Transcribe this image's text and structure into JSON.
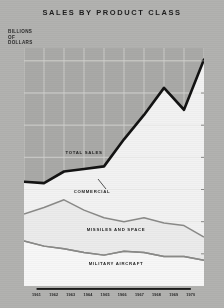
{
  "title": "SALES BY PRODUCT CLASS",
  "y_axis_label_lines": [
    "BILLIONS",
    "OF",
    "DOLLARS"
  ],
  "series_labels": {
    "total": "TOTAL SALES",
    "commercial": "COMMERCIAL",
    "missiles": "MISSILES AND SPACE",
    "military": "MILITARY AIRCRAFT"
  },
  "colors": {
    "background_upper": "#a9a9a7",
    "background_lower": "#f2f2f2",
    "total_line": "#131313",
    "sub_line": "#8a8a88",
    "text": "#1d1d1d",
    "grid": "#cfcfcd"
  },
  "chart_data": {
    "type": "line",
    "title": "SALES BY PRODUCT CLASS",
    "xlabel": "",
    "ylabel": "BILLIONS OF DOLLARS",
    "x": [
      1961,
      1962,
      1963,
      1964,
      1965,
      1966,
      1967,
      1968,
      1969,
      1970
    ],
    "categories": [
      "1961",
      "1962",
      "1963",
      "1964",
      "1965",
      "1966",
      "1967",
      "1968",
      "1969",
      "1970"
    ],
    "ylim": [
      0.0,
      3.7
    ],
    "yticks": [
      0.5,
      1.0,
      1.5,
      2.0,
      2.5,
      3.0,
      3.5
    ],
    "ytick_labels": [
      "0.5",
      "1.0",
      "1.5",
      "2.0",
      "2.5",
      "3.0",
      "3.5"
    ],
    "grid": true,
    "legend": "inline-annotations",
    "series": [
      {
        "name": "TOTAL SALES",
        "values": [
          1.62,
          1.6,
          1.78,
          1.82,
          1.86,
          2.28,
          2.66,
          3.08,
          2.74,
          3.52
        ]
      },
      {
        "name": "COMMERCIAL",
        "values": [
          1.12,
          1.22,
          1.34,
          1.18,
          1.06,
          1.0,
          1.06,
          0.98,
          0.94,
          0.76
        ]
      },
      {
        "name": "MISSILES AND SPACE",
        "values": [
          0.7,
          0.62,
          0.58,
          0.52,
          0.48,
          0.54,
          0.52,
          0.46,
          0.46,
          0.4
        ]
      },
      {
        "name": "MILITARY AIRCRAFT",
        "values": [
          0.7,
          0.62,
          0.58,
          0.52,
          0.48,
          0.54,
          0.52,
          0.46,
          0.46,
          0.4
        ]
      }
    ],
    "annotations": [
      {
        "text": "TOTAL SALES",
        "x": 1964,
        "y": 2.05
      },
      {
        "text": "COMMERCIAL",
        "x": 1964.4,
        "y": 1.45
      },
      {
        "text": "MISSILES AND SPACE",
        "x": 1965.6,
        "y": 0.86
      },
      {
        "text": "MILITARY AIRCRAFT",
        "x": 1965.6,
        "y": 0.33
      }
    ]
  }
}
